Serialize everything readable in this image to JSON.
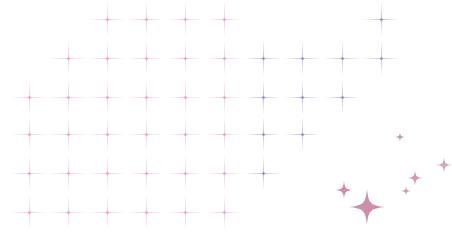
{
  "background": "#ffffff",
  "pattern": {
    "type": "crosshair-grid",
    "spacing": 39,
    "columns": [
      29,
      68,
      107,
      146,
      185,
      224,
      263,
      302,
      342,
      381
    ],
    "rows": [
      19,
      58,
      97,
      134,
      173,
      212
    ],
    "colors": {
      "pink": "#e8a3b6",
      "purple": "#8e8fc4"
    },
    "crosses": [
      {
        "x": 107,
        "y": 19,
        "c": "pink"
      },
      {
        "x": 146,
        "y": 19,
        "c": "pink"
      },
      {
        "x": 185,
        "y": 19,
        "c": "pink"
      },
      {
        "x": 224,
        "y": 19,
        "c": "pink"
      },
      {
        "x": 381,
        "y": 19,
        "c": "purple"
      },
      {
        "x": 68,
        "y": 58,
        "c": "pink"
      },
      {
        "x": 107,
        "y": 58,
        "c": "pink"
      },
      {
        "x": 146,
        "y": 58,
        "c": "pink"
      },
      {
        "x": 185,
        "y": 58,
        "c": "pink"
      },
      {
        "x": 224,
        "y": 58,
        "c": "pink"
      },
      {
        "x": 263,
        "y": 58,
        "c": "purple"
      },
      {
        "x": 302,
        "y": 58,
        "c": "purple"
      },
      {
        "x": 342,
        "y": 58,
        "c": "purple"
      },
      {
        "x": 381,
        "y": 58,
        "c": "purple"
      },
      {
        "x": 29,
        "y": 97,
        "c": "pink"
      },
      {
        "x": 68,
        "y": 97,
        "c": "pink"
      },
      {
        "x": 107,
        "y": 97,
        "c": "pink"
      },
      {
        "x": 146,
        "y": 97,
        "c": "pink"
      },
      {
        "x": 185,
        "y": 97,
        "c": "pink"
      },
      {
        "x": 224,
        "y": 97,
        "c": "pink"
      },
      {
        "x": 263,
        "y": 97,
        "c": "purple"
      },
      {
        "x": 302,
        "y": 97,
        "c": "purple"
      },
      {
        "x": 342,
        "y": 97,
        "c": "purple"
      },
      {
        "x": 29,
        "y": 134,
        "c": "pink"
      },
      {
        "x": 68,
        "y": 134,
        "c": "pink"
      },
      {
        "x": 107,
        "y": 134,
        "c": "pink"
      },
      {
        "x": 146,
        "y": 134,
        "c": "pink"
      },
      {
        "x": 185,
        "y": 134,
        "c": "pink"
      },
      {
        "x": 224,
        "y": 134,
        "c": "pink"
      },
      {
        "x": 263,
        "y": 134,
        "c": "purple"
      },
      {
        "x": 302,
        "y": 134,
        "c": "purple"
      },
      {
        "x": 29,
        "y": 173,
        "c": "pink"
      },
      {
        "x": 68,
        "y": 173,
        "c": "pink"
      },
      {
        "x": 107,
        "y": 173,
        "c": "pink"
      },
      {
        "x": 146,
        "y": 173,
        "c": "pink"
      },
      {
        "x": 185,
        "y": 173,
        "c": "pink"
      },
      {
        "x": 224,
        "y": 173,
        "c": "pink"
      },
      {
        "x": 263,
        "y": 173,
        "c": "purple"
      },
      {
        "x": 29,
        "y": 212,
        "c": "pink"
      },
      {
        "x": 68,
        "y": 212,
        "c": "pink"
      },
      {
        "x": 107,
        "y": 212,
        "c": "pink"
      },
      {
        "x": 146,
        "y": 212,
        "c": "pink"
      },
      {
        "x": 185,
        "y": 212,
        "c": "pink"
      },
      {
        "x": 224,
        "y": 212,
        "c": "pink"
      }
    ]
  },
  "sparkles": [
    {
      "x": 400,
      "y": 137,
      "size": 5,
      "color": "#b08aa8"
    },
    {
      "x": 444,
      "y": 165,
      "size": 8,
      "color": "#c79ab0"
    },
    {
      "x": 415,
      "y": 178,
      "size": 8,
      "color": "#c98aa6"
    },
    {
      "x": 406,
      "y": 191,
      "size": 5,
      "color": "#c48aa8"
    },
    {
      "x": 344,
      "y": 190,
      "size": 9,
      "color": "#c77a9c"
    },
    {
      "x": 367,
      "y": 207,
      "size": 18,
      "color": "#c77a9e"
    }
  ]
}
